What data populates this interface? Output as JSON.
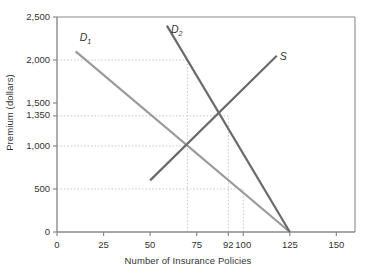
{
  "chart_data": {
    "type": "line",
    "title": "",
    "xlabel": "Number of Insurance Policies",
    "ylabel": "Premium (dollars)",
    "xlim": [
      0,
      160
    ],
    "ylim": [
      0,
      2500
    ],
    "grid": "dotted-partial",
    "legend_position": "inline-curve-labels",
    "xticks": [
      0,
      25,
      50,
      75,
      92,
      100,
      125,
      150
    ],
    "xtick_labels": [
      "0",
      "25",
      "50",
      "75",
      "92",
      "100",
      "125",
      "150"
    ],
    "yticks": [
      0,
      500,
      1000,
      1350,
      1500,
      2000,
      2500
    ],
    "ytick_labels": [
      "0",
      "500",
      "1,000",
      "1,350",
      "1,500",
      "2,000",
      "2,500"
    ],
    "series": [
      {
        "name": "D1",
        "label": "D",
        "label_sub": "1",
        "color": "#9a9a9a",
        "points": [
          [
            10,
            2100
          ],
          [
            125,
            0
          ]
        ]
      },
      {
        "name": "D2",
        "label": "D",
        "label_sub": "2",
        "color": "#6a6a6a",
        "points": [
          [
            59,
            2400
          ],
          [
            125,
            0
          ]
        ]
      },
      {
        "name": "S",
        "label": "S",
        "label_sub": "",
        "color": "#6a6a6a",
        "points": [
          [
            50,
            600
          ],
          [
            118,
            2050
          ]
        ]
      }
    ],
    "annotations": [
      {
        "name": "equilibrium-d1-s",
        "x": 70,
        "y": 1000
      },
      {
        "name": "equilibrium-d2-s",
        "x": 92,
        "y": 1350
      }
    ],
    "gridlines_horizontal": [
      {
        "value": 2000,
        "x_end": 70
      },
      {
        "value": 1350,
        "x_end": 92
      },
      {
        "value": 1000,
        "x_end": 70
      },
      {
        "value": 500,
        "x_end": 100
      }
    ],
    "gridlines_vertical": [
      {
        "value": 70,
        "y_end": 2000
      },
      {
        "value": 92,
        "y_end": 1350
      },
      {
        "value": 100,
        "y_end": 500
      }
    ]
  },
  "colors": {
    "axis": "#8a8a8a",
    "grid": "#c9c9c9",
    "text": "#333333",
    "demand1": "#9a9a9a",
    "demand2": "#6a6a6a",
    "supply": "#6a6a6a"
  }
}
